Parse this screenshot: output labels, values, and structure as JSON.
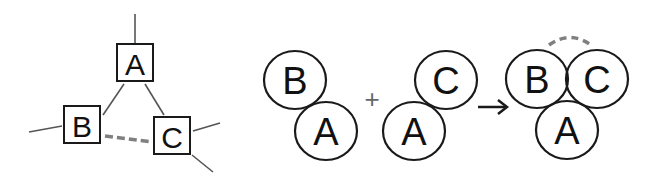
{
  "colors": {
    "stroke": "#1a1a1a",
    "line": "#555555",
    "dashed": "#808080",
    "background": "#ffffff"
  },
  "left_diagram": {
    "nodes": [
      {
        "id": "A",
        "label": "A",
        "shape": "square"
      },
      {
        "id": "B",
        "label": "B",
        "shape": "square"
      },
      {
        "id": "C",
        "label": "C",
        "shape": "square"
      }
    ],
    "edges": [
      {
        "from": "A",
        "to": "B",
        "style": "solid"
      },
      {
        "from": "A",
        "to": "C",
        "style": "solid"
      },
      {
        "from": "B",
        "to": "C",
        "style": "dashed"
      }
    ]
  },
  "right_diagram": {
    "group1": {
      "top": "B",
      "bottom": "A"
    },
    "operator": "+",
    "group2": {
      "top": "C",
      "bottom": "A"
    },
    "arrow": "arrow-right",
    "result": {
      "top_left": "B",
      "top_right": "C",
      "bottom": "A",
      "arc": "dashed"
    }
  }
}
